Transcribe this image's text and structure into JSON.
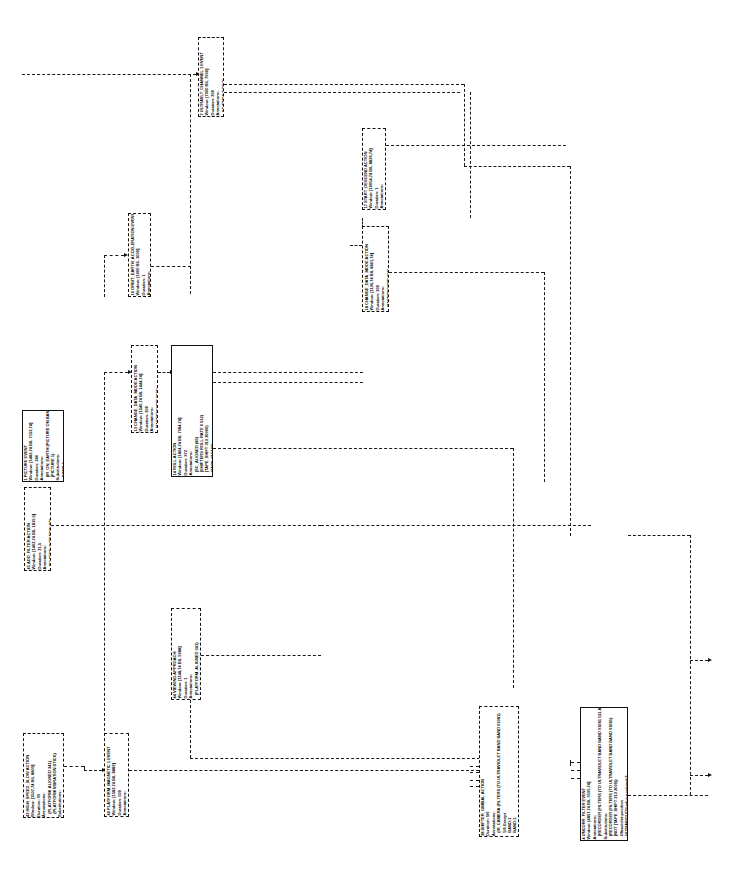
{
  "diagram": {
    "orientation": "text rotated 90 degrees counter-clockwise",
    "background_color": "#ffffff",
    "line_color": "#1a1a1a",
    "line_style": "dashed",
    "node_count": 13
  },
  "nodes": [
    {
      "id": "n7",
      "name": "ultravlt-channel-1-event",
      "x": 198,
      "y": 37,
      "w": 26,
      "h": 80,
      "border": "dashed",
      "lines": [
        "7 ULTRAVLT_CHANNEL 1 EVENT",
        "Window: [7000 BIL 7900]",
        "Duration: 300",
        "Annotations:",
        "   (ULTRAVLT (21,2)"
      ]
    },
    {
      "id": "n10",
      "name": "orbit-earth-acceleration-event",
      "x": 128,
      "y": 213,
      "w": 23,
      "h": 84,
      "border": "dashed",
      "lines": [
        "10 ORBIT_EARTH_ACCELERATION EVENT",
        "Window: [1000 BIL 1000]",
        "Duration: 1",
        "Annotations:",
        "   (EARTH REVOLVING)"
      ]
    },
    {
      "id": "n17",
      "name": "start-descend-action",
      "x": 362,
      "y": 128,
      "w": 24,
      "h": 82,
      "border": "dashed",
      "lines": [
        "17 START_DESCEND ACTION",
        "Window: [10054,74 BIL 8836,74]",
        "Duration: 1",
        "Annotations:",
        "   (TAPE_RECORDER DESCENDING)"
      ]
    },
    {
      "id": "n18",
      "name": "change-data-mode-action-18",
      "x": 362,
      "y": 226,
      "w": 27,
      "h": 86,
      "border": "dashed",
      "lines": [
        "18 CHANGE_DATA_MODE ACTION",
        "Window: [1136,74 BIL 8801,74]",
        "Duration: 300",
        "Annotations:",
        "   (TAPERECORD 192)",
        "Substitutions:",
        "   OBJ1Mode:1",
        "   OBJ1Mode:1"
      ]
    },
    {
      "id": "n13",
      "name": "change-data-mode-action-13",
      "x": 131,
      "y": 345,
      "w": 27,
      "h": 88,
      "border": "dashed",
      "lines": [
        "13 CHANGE_DATA_MODE ACTION",
        "Window: [1540,74 BIL 1444,74]",
        "Duration: 300",
        "Annotations:",
        "   (TAPERECORD 0031)",
        "Substitutions:",
        "   OBJ1Mode:1",
        "   OBJ1Mode:1"
      ]
    },
    {
      "id": "n14",
      "name": "roll-action",
      "x": 171,
      "y": 345,
      "w": 42,
      "h": 132,
      "border": "solid",
      "lines": [
        "14 ROLL ACTION",
        "Window: [1804,74 BIL 7984,74]",
        "Duration: 372",
        "Annotations:",
        "   (SC_ALIGNED (80)",
        "   (SHIFTERS ROLL RATE 0 512)",
        "   (TAPE_SHIFT 313 20000)",
        "   (TAPE:47 5133)",
        "   (LOCKED OBJ ACTIONED)",
        "   (NOT TAPE_SHIFT 0 20000)",
        "Substitutions:",
        "   OBJ:Final:element",
        "   SC(Final):position",
        "   S1(t):start:position",
        "   ACTIONED(before:version):F",
        "   (LOOPING(before:version):1",
        "   IMMA:end:position"
      ]
    },
    {
      "id": "n11",
      "name": "add-filter-action",
      "x": 24,
      "y": 487,
      "w": 27,
      "h": 84,
      "border": "dashed",
      "lines": [
        "41 ADD_FILTER ACTION",
        "Window: [1402,74 BIL 1819,5]",
        "Duration: 21,5",
        "Annotations:",
        "   (FILTERS ULTRAVIOLET)",
        "Substitution:",
        "   21 BI_IN(final-vol)",
        "   BIN(Elem):1",
        "   ULTRAVIOLET(Vendor):2"
      ]
    },
    {
      "id": "n44",
      "name": "viewing-approach-action",
      "x": 171,
      "y": 608,
      "w": 30,
      "h": 92,
      "border": "dashed",
      "lines": [
        "44 VIEWING APPROACH",
        "Window: [1148,74 BIL 9288]",
        "Duration: 1",
        "Annotations:",
        "   (PLATFORM_ALIGNED 341)",
        "   (PLATFORM VIBRATION)",
        "Annotations:",
        "   -Vehicle(element)",
        "   Vehicle:element:attack",
        "   (Vehicle:element",
        "   (Vehicle:element"
      ]
    },
    {
      "id": "n43",
      "name": "high-speed-slow-action",
      "x": 23,
      "y": 733,
      "w": 41,
      "h": 85,
      "border": "dashed",
      "lines": [
        "43 HIGH_SPEED_SLOW ACTION",
        "Window: [1507,74 BIL 8803]",
        "Duration: 99",
        "Annotations:",
        "   (PLATFORM_ALIGNED 341)",
        "   (PLATFORM VIBRATION STICK)",
        "Substitutions:",
        "   -Vehicle:element",
        "   Vehicle:element",
        "   Vehicle:end:attack"
      ]
    },
    {
      "id": "n40",
      "name": "platform-magnetic-1-event",
      "x": 104,
      "y": 733,
      "w": 25,
      "h": 84,
      "border": "dashed",
      "lines": [
        "40 PLATFORM_MAGNETIC 1 EVENT",
        "Window: [1582,74 BIL 8883]",
        "Duration: 500",
        "Annotations:",
        "   (PLATFORM STILL)"
      ]
    },
    {
      "id": "n38",
      "name": "shifter-gimbal-action",
      "x": 479,
      "y": 706,
      "w": 40,
      "h": 131,
      "border": "dashed",
      "lines": [
        "38 SHIFTER_GIMBAL ACTION",
        "Duration: 5/6",
        "Annotations:",
        "   (IR_CAMERA (FILTERS (TO ULTRAVIOLET BAND BAND 91081)",
        "   5/6 Except",
        "   BAND:1",
        "   BAND:1",
        "   BAND:1",
        "Substitution:",
        "   ULTRAVIOLET(value:",
        "   BAND:element",
        "   (Filtered:"
      ]
    },
    {
      "id": "n4",
      "name": "uncorr-filter-event",
      "x": 580,
      "y": 707,
      "w": 48,
      "h": 134,
      "border": "solid",
      "lines": [
        "4 UNCORR_FILTER EVENT",
        "Window: [4857,74 BIL 9195,74]",
        "Annotations:",
        "   (RECORDER (FILTERS (TO ULTRAVIOLET BAND BAND 91081 511 ANY))",
        "Substitutions:",
        "   (RECORDER (FILTERS (TO ULTRAVIOLET BAND BAND 91081)",
        "   (NOT (TAPE_SHIFT 313 2000))",
        "   Ultraviolet:position",
        "   ULTRAVIOLET(value:position):3",
        "   BAND:element",
        "   BAND:1",
        "   BAND:1",
        "   BAND:1",
        "Substitutions:",
        "   ULTRAVIOLET(value:",
        "   (Filtered:"
      ]
    },
    {
      "id": "n1",
      "name": "picture-event",
      "x": 22,
      "y": 410,
      "w": 42,
      "h": 72,
      "border": "solid",
      "lines": [
        "1 PICTURE EVENT",
        "Window: [1483,74 BIL 7153,74]",
        "Duration: 186",
        "Annotations:",
        "   (IR_ON_EARTH (PICTURE ON BAND BAND 1500 15381)",
        "   (PICTURE 1)",
        "Substitutions:",
        "   BAND:1",
        "   BAND:1",
        "   BAND:1"
      ]
    }
  ],
  "edges": [
    {
      "name": "edge-left-top-to-n7",
      "style": "dashed"
    },
    {
      "name": "edge-n7-to-right",
      "style": "dashed"
    },
    {
      "name": "edge-n10-to-n7",
      "style": "dashed"
    },
    {
      "name": "edge-n13-to-n14",
      "style": "dashed"
    },
    {
      "name": "edge-n14-to-n18",
      "style": "dashed"
    },
    {
      "name": "edge-n17-to-right",
      "style": "dashed"
    },
    {
      "name": "edge-n18-to-right",
      "style": "dashed"
    },
    {
      "name": "edge-n11-to-right",
      "style": "dashed"
    },
    {
      "name": "edge-n43-to-n40",
      "style": "dashed"
    },
    {
      "name": "edge-n40-to-right",
      "style": "dashed"
    },
    {
      "name": "edge-n44-to-down",
      "style": "dashed"
    },
    {
      "name": "edge-to-n38",
      "style": "dashed"
    },
    {
      "name": "edge-to-n4",
      "style": "dashed"
    }
  ]
}
